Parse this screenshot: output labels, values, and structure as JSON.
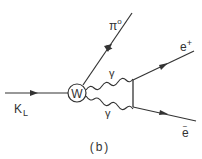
{
  "diagram": {
    "type": "feynman",
    "caption": "(b)",
    "vertex_label": "W",
    "particles": {
      "incoming": {
        "label": "K",
        "subscript": "L"
      },
      "pion": {
        "label": "π",
        "superscript": "o"
      },
      "photon_upper": {
        "label": "γ"
      },
      "photon_lower": {
        "label": "γ"
      },
      "positron": {
        "label": "e",
        "superscript": "+"
      },
      "electron": {
        "label": "e",
        "superscript": "−"
      }
    },
    "colors": {
      "line": "#333333",
      "background": "#ffffff"
    }
  }
}
